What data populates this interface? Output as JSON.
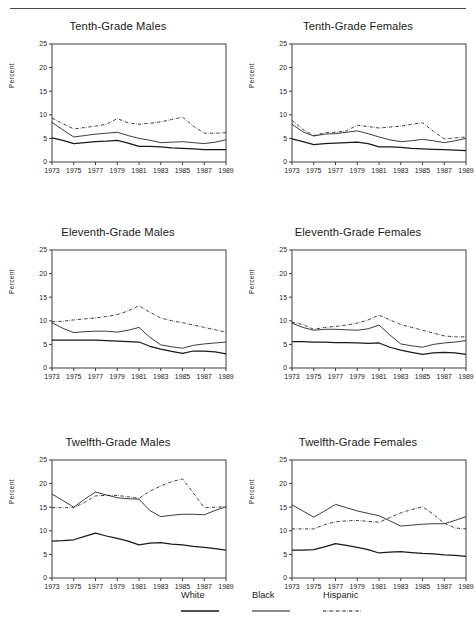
{
  "figure": {
    "ylabel": "Percent",
    "ylim": [
      0,
      25
    ],
    "yticks": [
      0,
      5,
      10,
      15,
      20,
      25
    ],
    "xticks": [
      1973,
      1975,
      1977,
      1979,
      1981,
      1983,
      1985,
      1987,
      1989
    ],
    "xlim": [
      1973,
      1989
    ]
  },
  "legend": {
    "items": [
      {
        "label": "White",
        "style": "solid",
        "color": "#1a1a1a"
      },
      {
        "label": "Black",
        "style": "solid-thin",
        "color": "#1a1a1a"
      },
      {
        "label": "Hispanic",
        "style": "dash-dot",
        "color": "#1a1a1a"
      }
    ]
  },
  "chart_data": [
    {
      "type": "line",
      "title": "Tenth-Grade Males",
      "xlabel": "",
      "ylabel": "Percent",
      "ylim": [
        0,
        25
      ],
      "grid": false,
      "legend_position": "below-figure",
      "x": [
        1973,
        1974,
        1975,
        1976,
        1977,
        1978,
        1979,
        1980,
        1981,
        1982,
        1983,
        1984,
        1985,
        1986,
        1987,
        1988,
        1989
      ],
      "series": [
        {
          "name": "White",
          "values": [
            5.1,
            4.6,
            3.9,
            4.1,
            4.3,
            4.4,
            4.6,
            4.0,
            3.3,
            3.3,
            3.2,
            3.0,
            2.9,
            2.8,
            2.6,
            2.6,
            2.6
          ]
        },
        {
          "name": "Black",
          "values": [
            8.4,
            6.8,
            5.3,
            5.6,
            5.9,
            6.1,
            6.3,
            5.6,
            5.0,
            4.6,
            4.1,
            4.2,
            4.3,
            4.1,
            3.9,
            4.2,
            4.7
          ]
        },
        {
          "name": "Hispanic",
          "values": [
            9.3,
            8.1,
            7.0,
            7.3,
            7.6,
            8.0,
            9.2,
            8.3,
            8.0,
            8.2,
            8.5,
            9.0,
            9.5,
            7.6,
            6.1,
            6.1,
            6.2
          ]
        }
      ]
    },
    {
      "type": "line",
      "title": "Tenth-Grade Females",
      "xlabel": "",
      "ylabel": "Percent",
      "ylim": [
        0,
        25
      ],
      "grid": false,
      "legend_position": "below-figure",
      "x": [
        1973,
        1974,
        1975,
        1976,
        1977,
        1978,
        1979,
        1980,
        1981,
        1982,
        1983,
        1984,
        1985,
        1986,
        1987,
        1988,
        1989
      ],
      "series": [
        {
          "name": "White",
          "values": [
            4.9,
            4.3,
            3.7,
            3.9,
            4.0,
            4.1,
            4.2,
            3.9,
            3.2,
            3.2,
            3.1,
            2.9,
            2.8,
            2.7,
            2.6,
            2.5,
            2.4
          ]
        },
        {
          "name": "Black",
          "values": [
            8.0,
            6.4,
            5.5,
            5.9,
            6.0,
            6.3,
            6.6,
            6.0,
            5.3,
            4.7,
            4.3,
            4.5,
            4.8,
            4.5,
            4.1,
            4.5,
            5.0
          ]
        },
        {
          "name": "Hispanic",
          "values": [
            8.8,
            6.9,
            5.6,
            6.2,
            6.3,
            6.6,
            7.8,
            7.5,
            7.2,
            7.4,
            7.6,
            8.0,
            8.3,
            6.5,
            4.9,
            5.1,
            5.3
          ]
        }
      ]
    },
    {
      "type": "line",
      "title": "Eleventh-Grade Males",
      "xlabel": "",
      "ylabel": "Percent",
      "ylim": [
        0,
        25
      ],
      "grid": false,
      "legend_position": "below-figure",
      "x": [
        1973,
        1974,
        1975,
        1976,
        1977,
        1978,
        1979,
        1980,
        1981,
        1982,
        1983,
        1984,
        1985,
        1986,
        1987,
        1988,
        1989
      ],
      "series": [
        {
          "name": "White",
          "values": [
            5.9,
            5.9,
            5.9,
            5.9,
            5.9,
            5.8,
            5.7,
            5.6,
            5.5,
            4.6,
            4.0,
            3.5,
            3.1,
            3.6,
            3.6,
            3.4,
            3.0
          ]
        },
        {
          "name": "Black",
          "values": [
            9.6,
            8.4,
            7.5,
            7.7,
            7.8,
            7.8,
            7.6,
            8.0,
            8.6,
            6.5,
            4.9,
            4.5,
            4.2,
            4.8,
            5.1,
            5.3,
            5.5
          ]
        },
        {
          "name": "Hispanic",
          "values": [
            9.8,
            9.9,
            10.2,
            10.4,
            10.6,
            10.9,
            11.3,
            12.1,
            13.2,
            11.8,
            10.6,
            10.0,
            9.6,
            9.1,
            8.6,
            8.1,
            7.6
          ]
        }
      ]
    },
    {
      "type": "line",
      "title": "Eleventh-Grade Females",
      "xlabel": "",
      "ylabel": "Percent",
      "ylim": [
        0,
        25
      ],
      "grid": false,
      "legend_position": "below-figure",
      "x": [
        1973,
        1974,
        1975,
        1976,
        1977,
        1978,
        1979,
        1980,
        1981,
        1982,
        1983,
        1984,
        1985,
        1986,
        1987,
        1988,
        1989
      ],
      "series": [
        {
          "name": "White",
          "values": [
            5.6,
            5.6,
            5.5,
            5.5,
            5.4,
            5.4,
            5.3,
            5.2,
            5.3,
            4.4,
            3.8,
            3.3,
            2.9,
            3.2,
            3.3,
            3.2,
            2.9
          ]
        },
        {
          "name": "Black",
          "values": [
            9.5,
            8.6,
            8.0,
            8.2,
            8.2,
            8.1,
            8.0,
            8.3,
            9.1,
            7.0,
            5.1,
            4.7,
            4.4,
            5.0,
            5.3,
            5.5,
            5.8
          ]
        },
        {
          "name": "Hispanic",
          "values": [
            9.7,
            9.2,
            8.2,
            8.6,
            8.8,
            9.1,
            9.5,
            10.2,
            11.2,
            10.2,
            9.2,
            8.6,
            8.0,
            7.4,
            6.8,
            6.6,
            6.6
          ]
        }
      ]
    },
    {
      "type": "line",
      "title": "Twelfth-Grade Males",
      "xlabel": "",
      "ylabel": "Percent",
      "ylim": [
        0,
        25
      ],
      "grid": false,
      "legend_position": "below-figure",
      "x": [
        1973,
        1974,
        1975,
        1976,
        1977,
        1978,
        1979,
        1980,
        1981,
        1982,
        1983,
        1984,
        1985,
        1986,
        1987,
        1988,
        1989
      ],
      "series": [
        {
          "name": "White",
          "values": [
            7.8,
            7.9,
            8.1,
            8.8,
            9.5,
            8.9,
            8.4,
            7.8,
            7.0,
            7.4,
            7.5,
            7.2,
            7.0,
            6.7,
            6.5,
            6.2,
            5.9
          ]
        },
        {
          "name": "Black",
          "values": [
            17.8,
            16.4,
            15.0,
            16.7,
            18.2,
            17.6,
            17.0,
            16.8,
            16.7,
            14.3,
            13.0,
            13.3,
            13.5,
            13.5,
            13.4,
            14.3,
            15.1
          ]
        },
        {
          "name": "Hispanic",
          "values": [
            14.9,
            14.9,
            14.9,
            16.0,
            17.4,
            17.5,
            17.5,
            17.2,
            16.9,
            18.4,
            19.5,
            20.4,
            21.0,
            18.0,
            14.9,
            15.0,
            15.1
          ]
        }
      ]
    },
    {
      "type": "line",
      "title": "Twelfth-Grade Females",
      "xlabel": "",
      "ylabel": "Percent",
      "ylim": [
        0,
        25
      ],
      "grid": false,
      "legend_position": "below-figure",
      "x": [
        1973,
        1974,
        1975,
        1976,
        1977,
        1978,
        1979,
        1980,
        1981,
        1982,
        1983,
        1984,
        1985,
        1986,
        1987,
        1988,
        1989
      ],
      "series": [
        {
          "name": "White",
          "values": [
            5.9,
            5.9,
            6.0,
            6.6,
            7.3,
            6.9,
            6.5,
            6.0,
            5.3,
            5.5,
            5.6,
            5.4,
            5.2,
            5.1,
            4.9,
            4.8,
            4.6
          ]
        },
        {
          "name": "Black",
          "values": [
            15.5,
            14.2,
            12.9,
            14.2,
            15.6,
            14.9,
            14.2,
            13.7,
            13.2,
            12.1,
            11.0,
            11.2,
            11.4,
            11.5,
            11.5,
            12.2,
            13.0
          ]
        },
        {
          "name": "Hispanic",
          "values": [
            10.4,
            10.4,
            10.4,
            11.3,
            11.9,
            12.1,
            12.2,
            12.0,
            11.8,
            12.8,
            13.8,
            14.5,
            15.1,
            13.5,
            11.6,
            10.6,
            10.4
          ]
        }
      ]
    }
  ]
}
